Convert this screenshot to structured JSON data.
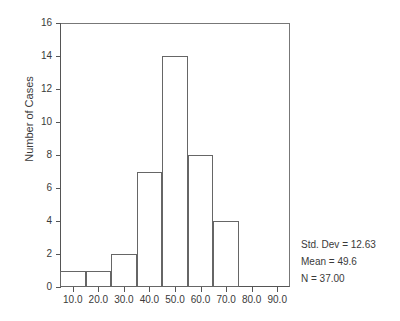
{
  "chart_data": {
    "type": "bar",
    "title": "",
    "xlabel": "",
    "ylabel": "Number of Cases",
    "categories": [
      "5-15",
      "15-25",
      "25-35",
      "35-45",
      "45-55",
      "55-65",
      "65-75"
    ],
    "bin_edges": [
      5,
      15,
      25,
      35,
      45,
      55,
      65,
      75
    ],
    "values": [
      1,
      1,
      2,
      7,
      14,
      8,
      4
    ],
    "xlim": [
      5,
      95
    ],
    "ylim": [
      0,
      16
    ],
    "xticks": [
      10,
      20,
      30,
      40,
      50,
      60,
      70,
      80,
      90
    ],
    "xtick_labels": [
      "10.0",
      "20.0",
      "30.0",
      "40.0",
      "50.0",
      "60.0",
      "70.0",
      "80.0",
      "90.0"
    ],
    "yticks": [
      0,
      2,
      4,
      6,
      8,
      10,
      12,
      14,
      16
    ],
    "ytick_labels": [
      "0",
      "2",
      "4",
      "6",
      "8",
      "10",
      "12",
      "14",
      "16"
    ],
    "grid": false,
    "legend": "none",
    "bar_fill": "#ffffff",
    "bar_edge": "#666666",
    "annotations": [
      "Std. Dev = 12.63",
      "Mean = 49.6",
      "N = 37.00"
    ]
  },
  "stats": {
    "std_dev": "Std. Dev = 12.63",
    "mean": "Mean = 49.6",
    "n": "N = 37.00"
  }
}
